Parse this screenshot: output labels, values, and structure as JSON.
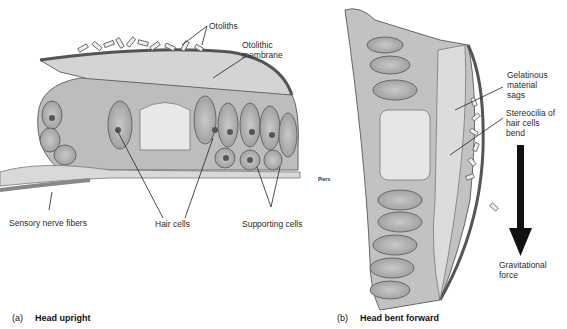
{
  "figure": {
    "panel_a": {
      "letter": "(a)",
      "title": "Head upright",
      "labels": {
        "otoliths": "Otoliths",
        "otolithic_membrane_1": "Otolithic",
        "otolithic_membrane_2": "membrane",
        "sensory_nerve_fibers": "Sensory nerve fibers",
        "hair_cells": "Hair cells",
        "supporting_cells": "Supporting cells"
      },
      "signature": "Piers"
    },
    "panel_b": {
      "letter": "(b)",
      "title": "Head bent forward",
      "labels": {
        "gelatinous_1": "Gelatinous",
        "gelatinous_2": "material",
        "gelatinous_3": "sags",
        "stereocilia_1": "Stereocilia of",
        "stereocilia_2": "hair cells",
        "stereocilia_3": "bend",
        "gravity_1": "Gravitational",
        "gravity_2": "force"
      }
    }
  }
}
